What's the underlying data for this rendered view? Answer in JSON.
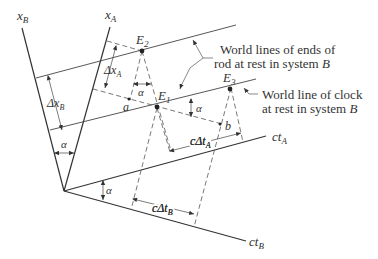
{
  "diagram": {
    "axes": {
      "xB": {
        "label": "x",
        "sub": "B"
      },
      "xA": {
        "label": "x",
        "sub": "A"
      },
      "ctA": {
        "label": "ct",
        "sub": "A"
      },
      "ctB": {
        "label": "ct",
        "sub": "B"
      }
    },
    "events": {
      "E1": {
        "label": "E",
        "sub": "1"
      },
      "E2": {
        "label": "E",
        "sub": "2"
      },
      "E3": {
        "label": "E",
        "sub": "3"
      }
    },
    "points": {
      "a": "a",
      "b": "b"
    },
    "angles": {
      "alpha": "α"
    },
    "dimensions": {
      "dxA": {
        "prefix": "Δx",
        "sub": "A"
      },
      "dxB": {
        "prefix": "Δx",
        "sub": "B"
      },
      "cdtA": {
        "prefix": "cΔt",
        "sub": "A"
      },
      "cdtB": {
        "prefix": "cΔt",
        "sub": "B"
      }
    },
    "annotations": {
      "rod_line1": "World lines of ends of",
      "rod_line2": "rod at rest in system",
      "rod_sys": "B",
      "clock_line1": "World line of clock",
      "clock_line2": "at rest in system",
      "clock_sys": "B"
    }
  }
}
